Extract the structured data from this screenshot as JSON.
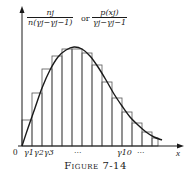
{
  "chart_data": {
    "type": "bar",
    "subtype": "histogram with density curve overlay",
    "title": "",
    "caption": "Figure 7-14",
    "ylabel": "n_j / (n(γ_j − γ_{j−1})) or p(x_j) / (γ_j − γ_{j−1})",
    "xlabel": "x",
    "origin_label": "0",
    "x_tick_labels": [
      "γ1",
      "γ2",
      "γ3",
      "···",
      "γ10",
      "···"
    ],
    "grid": false,
    "legend": null,
    "categories": [
      "1",
      "2",
      "3",
      "4",
      "5",
      "6",
      "7",
      "8",
      "9",
      "10",
      "11",
      "12",
      "13",
      "14"
    ],
    "values": [
      26,
      53,
      77,
      90,
      97,
      97,
      93,
      81,
      64,
      48,
      34,
      23,
      14,
      8
    ],
    "curve": {
      "description": "smooth right-skewed density curve starting at origin, peaking near bars 5-6, tailing off to the right",
      "points_px": [
        [
          22,
          146
        ],
        [
          28,
          128
        ],
        [
          35,
          108
        ],
        [
          42,
          88
        ],
        [
          50,
          70
        ],
        [
          58,
          57
        ],
        [
          66,
          50
        ],
        [
          74,
          47
        ],
        [
          82,
          49
        ],
        [
          90,
          56
        ],
        [
          98,
          67
        ],
        [
          106,
          80
        ],
        [
          114,
          94
        ],
        [
          122,
          106
        ],
        [
          130,
          117
        ],
        [
          138,
          125
        ],
        [
          146,
          132
        ],
        [
          154,
          137
        ],
        [
          162,
          140
        ]
      ]
    },
    "bars_px": [
      {
        "x": 22,
        "w": 10,
        "top": 120
      },
      {
        "x": 32,
        "w": 10,
        "top": 93
      },
      {
        "x": 42,
        "w": 10,
        "top": 69
      },
      {
        "x": 52,
        "w": 10,
        "top": 56
      },
      {
        "x": 62,
        "w": 10,
        "top": 49
      },
      {
        "x": 72,
        "w": 10,
        "top": 49
      },
      {
        "x": 82,
        "w": 10,
        "top": 53
      },
      {
        "x": 92,
        "w": 10,
        "top": 65
      },
      {
        "x": 102,
        "w": 10,
        "top": 82
      },
      {
        "x": 112,
        "w": 10,
        "top": 98
      },
      {
        "x": 122,
        "w": 10,
        "top": 112
      },
      {
        "x": 132,
        "w": 10,
        "top": 123
      },
      {
        "x": 142,
        "w": 10,
        "top": 132
      },
      {
        "x": 152,
        "w": 6,
        "top": 138
      }
    ]
  },
  "labels": {
    "frac1_num": "nj",
    "frac1_den": "n(γj−γj−1)",
    "or_text": "or",
    "frac2_num": "p(xj)",
    "frac2_den": "γj−γj−1",
    "origin": "0",
    "x_axis": "x",
    "tick_g1": "γ1",
    "tick_g2": "γ2",
    "tick_g3": "γ3",
    "tick_dots1": "···",
    "tick_g10": "γ10",
    "tick_dots2": "···",
    "caption": "Figure 7-14"
  },
  "colors": {
    "ink": "#1a1a1a",
    "bar_edge": "#555555",
    "background": "#ffffff"
  }
}
